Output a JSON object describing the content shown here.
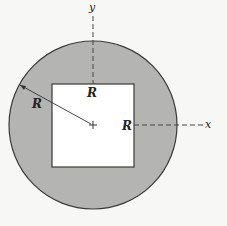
{
  "diagram": {
    "colors": {
      "background": "#f7f7f5",
      "disk_fill": "#b4b4b2",
      "hole_fill": "#ffffff",
      "stroke": "#3a3a3a"
    },
    "labels": {
      "y_axis": "y",
      "x_axis": "x",
      "radius_label": "R",
      "square_top_label": "R",
      "square_right_label": "R"
    },
    "origin_marker": "+"
  }
}
